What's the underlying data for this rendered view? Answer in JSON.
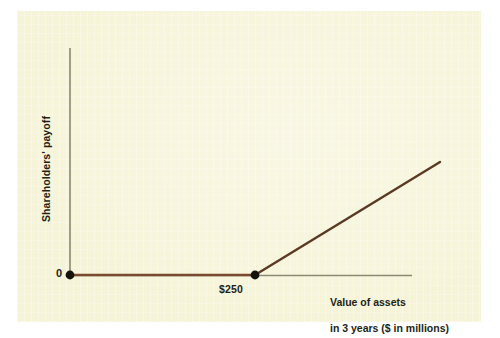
{
  "figure": {
    "background_color": "#ffffff",
    "panel_color": "#f6f4d8",
    "axis_color": "#8a8a72",
    "line_color": "#5a3a24",
    "flat_segment_color": "#7a4a2e",
    "marker_color": "#15120c",
    "text_color": "#231f16"
  },
  "axes": {
    "y_label": "Shareholders' payoff",
    "x_label_line1": "Value of assets",
    "x_label_line2": "in 3 years ($ in millions)",
    "origin_tick_label": "0",
    "x_tick_label": "$250"
  },
  "chart_data": {
    "type": "line",
    "title": "",
    "subtitle": "",
    "xlabel": "Value of assets in 3 years ($ in millions)",
    "ylabel": "Shareholders' payoff",
    "grid": false,
    "legend": false,
    "legend_position": "none",
    "xlim": [
      0,
      500
    ],
    "ylim": [
      0,
      250
    ],
    "xticks": [
      0,
      250
    ],
    "xticklabels": [
      "0",
      "$250"
    ],
    "yticks": [
      0
    ],
    "yticklabels": [
      "0"
    ],
    "series": [
      {
        "name": "Shareholders' payoff",
        "comment": "Payoff is zero until asset value reaches $250 million, then rises one-for-one",
        "x": [
          0,
          250,
          500
        ],
        "y": [
          0,
          0,
          140
        ]
      }
    ],
    "annotations": [
      {
        "label": "0",
        "x": 0,
        "y": 0,
        "marker": "filled-circle"
      },
      {
        "label": "$250",
        "x": 250,
        "y": 0,
        "marker": "filled-circle"
      }
    ]
  }
}
